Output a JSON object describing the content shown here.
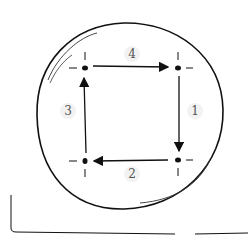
{
  "diagram": {
    "type": "cycle",
    "nodes": [
      {
        "id": "top-left",
        "x": 85,
        "y": 68
      },
      {
        "id": "top-right",
        "x": 178,
        "y": 68
      },
      {
        "id": "bottom-right",
        "x": 178,
        "y": 160
      },
      {
        "id": "bottom-left",
        "x": 85,
        "y": 161
      }
    ],
    "edges": [
      {
        "label": "1",
        "from": "top-right",
        "to": "bottom-right"
      },
      {
        "label": "2",
        "from": "bottom-right",
        "to": "bottom-left"
      },
      {
        "label": "3",
        "from": "bottom-left",
        "to": "top-left"
      },
      {
        "label": "4",
        "from": "top-left",
        "to": "top-right"
      }
    ],
    "labels": {
      "e1": "1",
      "e2": "2",
      "e3": "3",
      "e4": "4"
    },
    "colors": {
      "stroke": "#111111",
      "label": "#555555",
      "label_bg": "#f2f2f2"
    }
  }
}
